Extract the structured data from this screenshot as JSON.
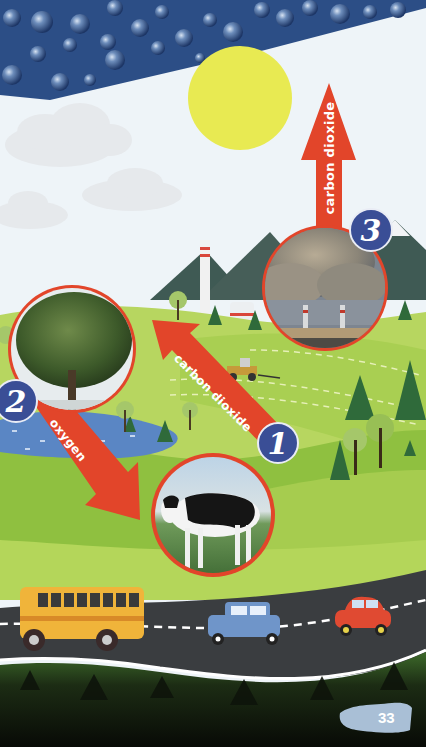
{
  "scene": {
    "title": "Carbon cycle illustration",
    "colors": {
      "sky": "#eef4f8",
      "rain_band": "#2c4e86",
      "sun": "#e8ea52",
      "arrow": "#e2452a",
      "badge": "#3a4e96",
      "grass_light": "#b7d660",
      "grass": "#8fc040",
      "grass_dark": "#5f9a32",
      "mountain": "#3f5a54",
      "water": "#5a86c4",
      "road": "#3a3d40",
      "forest": "#141c10"
    }
  },
  "arrows": [
    {
      "id": "arrow-3",
      "label": "carbon dioxide",
      "direction": "up",
      "from": "factory"
    },
    {
      "id": "arrow-1",
      "label": "carbon dioxide",
      "direction": "up-left",
      "from": "cow",
      "to": "tree"
    },
    {
      "id": "arrow-2",
      "label": "oxygen",
      "direction": "down-right",
      "from": "tree",
      "to": "cow"
    }
  ],
  "badges": [
    {
      "id": "badge-1",
      "number": "1",
      "subject": "cow"
    },
    {
      "id": "badge-2",
      "number": "2",
      "subject": "tree"
    },
    {
      "id": "badge-3",
      "number": "3",
      "subject": "factory"
    }
  ],
  "photos": [
    {
      "id": "photo-tree",
      "subject": "tree"
    },
    {
      "id": "photo-cow",
      "subject": "cow"
    },
    {
      "id": "photo-factory",
      "subject": "factory smokestacks"
    }
  ],
  "vehicles": [
    "school-bus",
    "blue-car",
    "red-car",
    "tractor"
  ],
  "page_number": "33"
}
